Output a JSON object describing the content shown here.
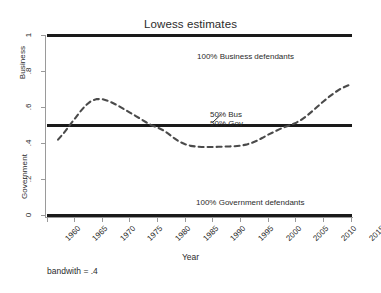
{
  "figure": {
    "title": "Lowess estimates",
    "footnote": "bandwith = .4",
    "background": "#ffffff"
  },
  "axes": {
    "x_title": "Year",
    "y_title_upper": "Business",
    "y_title_lower": "Government",
    "y_ticks": [
      "0",
      ".2",
      ".4",
      ".6",
      ".8",
      "1"
    ],
    "x_ticks": [
      "1960",
      "1965",
      "1970",
      "1975",
      "1980",
      "1985",
      "1990",
      "1995",
      "2000",
      "2005",
      "2010",
      "2015"
    ]
  },
  "annotations": {
    "business_line": "100% Business defendants",
    "government_line": "100% Government defendants",
    "fifty_bus": "50% Bus",
    "fifty_gov": "50% Gov"
  },
  "colors": {
    "line": "#1a1a1a",
    "curve": "#4a4a4a",
    "spine": "#9a9a9a",
    "text": "#2b2b2b"
  },
  "chart_data": {
    "type": "line",
    "title": "Lowess estimates",
    "xlabel": "Year",
    "ylabel": "Business / Government",
    "xlim": [
      1960,
      2015
    ],
    "ylim": [
      0,
      1
    ],
    "grid": false,
    "legend": "none",
    "subtitle": "bandwith = .4",
    "series": [
      {
        "name": "Lowess smoothed proportion business defendants",
        "style": "dashed",
        "color": "#4a4a4a",
        "x": [
          1962,
          1963,
          1964,
          1965,
          1966,
          1967,
          1968,
          1969,
          1970,
          1971,
          1972,
          1973,
          1974,
          1975,
          1976,
          1977,
          1978,
          1979,
          1980,
          1981,
          1982,
          1983,
          1984,
          1985,
          1986,
          1987,
          1988,
          1989,
          1990,
          1991,
          1992,
          1993,
          1994,
          1995,
          1996,
          1997,
          1998,
          1999,
          2000,
          2001,
          2002,
          2003,
          2004,
          2005,
          2006,
          2007,
          2008,
          2009,
          2010,
          2011,
          2012,
          2013,
          2014,
          2015
        ],
        "y": [
          0.42,
          0.455,
          0.495,
          0.535,
          0.575,
          0.61,
          0.635,
          0.645,
          0.645,
          0.636,
          0.622,
          0.606,
          0.588,
          0.57,
          0.552,
          0.534,
          0.515,
          0.498,
          0.487,
          0.472,
          0.452,
          0.428,
          0.408,
          0.394,
          0.385,
          0.381,
          0.379,
          0.379,
          0.379,
          0.38,
          0.381,
          0.382,
          0.383,
          0.386,
          0.392,
          0.401,
          0.414,
          0.43,
          0.447,
          0.462,
          0.477,
          0.49,
          0.5,
          0.512,
          0.53,
          0.552,
          0.578,
          0.605,
          0.632,
          0.657,
          0.68,
          0.7,
          0.715,
          0.727
        ]
      },
      {
        "name": "100% Business defendants reference",
        "style": "solid",
        "color": "#1a1a1a",
        "constant_y": 1.0
      },
      {
        "name": "50% Bus / 50% Gov reference",
        "style": "solid",
        "color": "#1a1a1a",
        "constant_y": 0.5
      },
      {
        "name": "100% Government defendants reference",
        "style": "solid",
        "color": "#1a1a1a",
        "constant_y": 0.0
      }
    ],
    "annotations": [
      {
        "text": "100% Business defendants",
        "x": 1992,
        "y": 0.93
      },
      {
        "text": "50% Bus",
        "x": 1995,
        "y": 0.575
      },
      {
        "text": "50% Gov",
        "x": 1995,
        "y": 0.535
      },
      {
        "text": "100% Government defendants",
        "x": 1992,
        "y": 0.075
      }
    ]
  }
}
